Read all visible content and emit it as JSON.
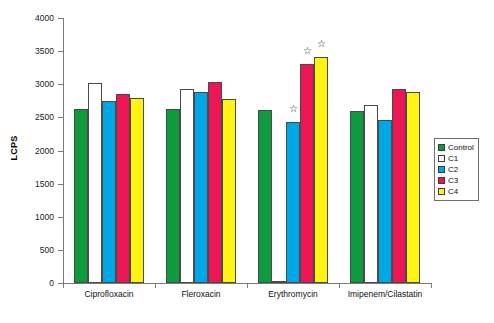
{
  "chart_data": {
    "type": "bar",
    "title": "",
    "xlabel": "",
    "ylabel": "LCPS",
    "ylim": [
      0,
      4000
    ],
    "ytick_labels": [
      "0",
      "500",
      "1000",
      "1500",
      "2000",
      "2500",
      "3000",
      "3500",
      "4000"
    ],
    "yticks": [
      0,
      500,
      1000,
      1500,
      2000,
      2500,
      3000,
      3500,
      4000
    ],
    "grid": false,
    "legend_position": "right",
    "categories": [
      "Ciprofloxacin",
      "Fleroxacin",
      "Erythromycin",
      "Imipenem/Cilastatin"
    ],
    "series": [
      {
        "name": "Control",
        "color": "#0e9b3d",
        "values": [
          2630,
          2625,
          2615,
          2600
        ]
      },
      {
        "name": "C1",
        "color": "#ffffff",
        "values": [
          3015,
          2930,
          20,
          2680
        ]
      },
      {
        "name": "C2",
        "color": "#00a7e6",
        "values": [
          2740,
          2880,
          2425,
          2455
        ]
      },
      {
        "name": "C3",
        "color": "#ec1654",
        "values": [
          2860,
          3040,
          3300,
          2930
        ]
      },
      {
        "name": "C4",
        "color": "#fff312",
        "values": [
          2800,
          2775,
          3410,
          2890
        ]
      }
    ],
    "annotations": [
      {
        "symbol": "☆",
        "category": "Erythromycin",
        "series": "C2"
      },
      {
        "symbol": "☆",
        "category": "Erythromycin",
        "series": "C3"
      },
      {
        "symbol": "☆",
        "category": "Erythromycin",
        "series": "C4"
      }
    ]
  },
  "legend": {
    "items": [
      {
        "label": "Control",
        "color": "#0e9b3d"
      },
      {
        "label": "C1",
        "color": "#ffffff"
      },
      {
        "label": "C2",
        "color": "#00a7e6"
      },
      {
        "label": "C3",
        "color": "#ec1654"
      },
      {
        "label": "C4",
        "color": "#fff312"
      }
    ]
  }
}
